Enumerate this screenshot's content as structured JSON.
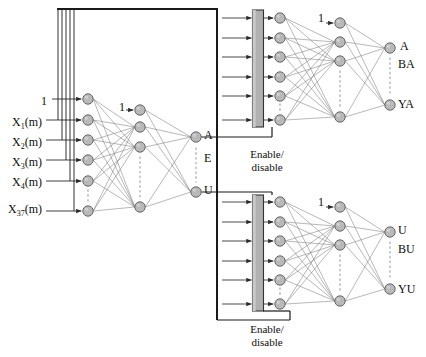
{
  "diagram": {
    "colors": {
      "node_fill": "#b9b9b9",
      "node_stroke": "#5a5a5a",
      "edge": "#7d7d7d",
      "bus": "#1a1a1a",
      "gate_fill": "#b0b0b0",
      "gate_stroke": "#333333",
      "dots": "#b5b5b5",
      "text": "#0d0d0d"
    }
  },
  "inputs": {
    "bias_label": "1",
    "items": [
      {
        "label": "X",
        "sub": "1",
        "suffix": "(m)"
      },
      {
        "label": "X",
        "sub": "2",
        "suffix": "(m)"
      },
      {
        "label": "X",
        "sub": "3",
        "suffix": "(m)"
      },
      {
        "label": "X",
        "sub": "4",
        "suffix": "(m)"
      },
      {
        "label": "X",
        "sub": "37",
        "suffix": "(m)"
      }
    ],
    "ellipsis": "vertical-dots"
  },
  "stage1": {
    "name": "first-stage-network",
    "hidden_bias_label": "1",
    "outputs": [
      {
        "label": "A"
      },
      {
        "label": "E"
      },
      {
        "label": "U"
      }
    ]
  },
  "gates": [
    {
      "name": "gate-upper",
      "line1": "Enable/",
      "line2": "disable",
      "driven_by": "A"
    },
    {
      "name": "gate-lower",
      "line1": "Enable/",
      "line2": "disable",
      "driven_by": "U"
    }
  ],
  "stage2_upper": {
    "name": "second-stage-network-a",
    "hidden_bias_label": "1",
    "outputs": [
      {
        "label": "A"
      },
      {
        "label": "BA"
      },
      {
        "label": "YA"
      }
    ]
  },
  "stage2_lower": {
    "name": "second-stage-network-u",
    "hidden_bias_label": "1",
    "outputs": [
      {
        "label": "U"
      },
      {
        "label": "BU"
      },
      {
        "label": "YU"
      }
    ]
  }
}
